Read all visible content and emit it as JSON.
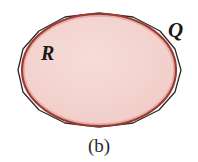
{
  "figure": {
    "caption": "(b)",
    "background_color": "#ffffff",
    "labels": {
      "region_label": "R",
      "polygon_label": "Q"
    },
    "colors": {
      "region_fill": "#f3d3cf",
      "region_stroke": "#9c3a34",
      "region_highlight": "#e8a79f",
      "polygon_stroke": "#2a2a2a",
      "caption_color": "#2b2b2b",
      "label_color": "#1a1a1a"
    }
  },
  "chart_data": {
    "type": "diagram",
    "title": "(b)",
    "shapes": [
      {
        "name": "region-R-ellipse",
        "kind": "ellipse",
        "label": "R",
        "cx": 99,
        "cy": 70,
        "rx": 77,
        "ry": 56,
        "fill": "#f3d3cf",
        "stroke": "#9c3a34",
        "stroke_width": 2.2
      },
      {
        "name": "polygon-Q",
        "kind": "polygon",
        "label": "Q",
        "sides": 14,
        "fill": "none",
        "stroke": "#2a2a2a",
        "stroke_width": 1.3,
        "points": [
          [
            99,
            13
          ],
          [
            133,
            17
          ],
          [
            160,
            31
          ],
          [
            175,
            49
          ],
          [
            181,
            70
          ],
          [
            175,
            92
          ],
          [
            159,
            110
          ],
          [
            133,
            123
          ],
          [
            99,
            127
          ],
          [
            65,
            123
          ],
          [
            39,
            110
          ],
          [
            23,
            92
          ],
          [
            18,
            70
          ],
          [
            23,
            49
          ],
          [
            39,
            31
          ],
          [
            65,
            17
          ]
        ]
      }
    ],
    "annotations": [
      {
        "text": "R",
        "x": 48,
        "y": 55,
        "style": "italic-serif"
      },
      {
        "text": "Q",
        "x": 177,
        "y": 32,
        "style": "italic-serif"
      },
      {
        "text": "(b)",
        "x": 99,
        "y": 148,
        "style": "serif"
      }
    ]
  }
}
